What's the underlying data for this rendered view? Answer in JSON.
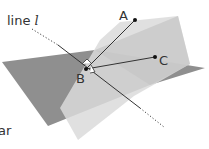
{
  "diagram": {
    "line_label": "line",
    "line_name": "l",
    "points": {
      "A": "A",
      "B": "B",
      "C": "C"
    },
    "cut_caption": "ar",
    "colors": {
      "horizontal_plane": "#8c8c8c",
      "vertical_plane": "#dcdcdc",
      "overlap_plane": "#bdbdbd",
      "line": "#333333",
      "point": "#111111"
    }
  }
}
